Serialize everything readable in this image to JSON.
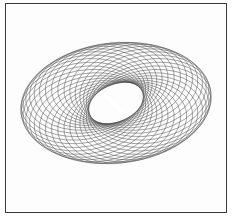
{
  "figure": {
    "type": "torus-line-drawing",
    "frame": {
      "x": 5,
      "y": 3,
      "width": 222,
      "height": 210,
      "stroke": "#3a3a3a"
    },
    "curves": {
      "count": 34,
      "center": [
        116,
        103
      ],
      "base_rx": 62,
      "base_ry": 40,
      "orbit_rx": 34,
      "orbit_ry": 20,
      "rotation_deg": -10,
      "stroke": "#4a4a4a",
      "stroke_width": 0.55,
      "opacity": 0.85
    },
    "hole": {
      "cx": 114,
      "cy": 104,
      "rx": 16,
      "ry": 2.5,
      "rotation_deg": 42,
      "fill": "#ffffff"
    }
  }
}
